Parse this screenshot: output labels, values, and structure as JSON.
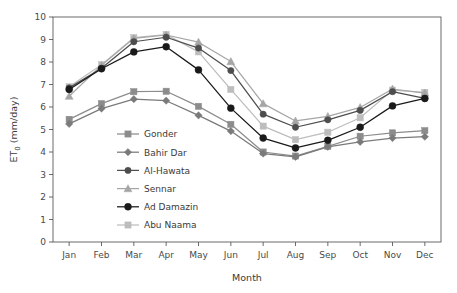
{
  "chart_data": {
    "type": "line",
    "title": "",
    "xlabel": "Month",
    "ylabel": "ET0 (mm/day)",
    "ylabel_base": "ET",
    "ylabel_sub": "0",
    "ylabel_unit": " (mm/day)",
    "categories": [
      "Jan",
      "Feb",
      "Mar",
      "Apr",
      "May",
      "Jun",
      "Jul",
      "Aug",
      "Sep",
      "Oct",
      "Nov",
      "Dec"
    ],
    "ylim": [
      0,
      10
    ],
    "yticks": [
      "0",
      "1",
      "2",
      "3",
      "4",
      "5",
      "6",
      "7",
      "8",
      "9",
      "10"
    ],
    "grid": false,
    "legend_position": "inside-center-left",
    "series": [
      {
        "name": "Gonder",
        "color": "#8c8c8c",
        "marker": "square",
        "values": [
          5.45,
          6.15,
          6.68,
          6.7,
          6.03,
          5.23,
          4.0,
          3.82,
          4.25,
          4.7,
          4.85,
          4.95
        ]
      },
      {
        "name": "Bahir Dar",
        "color": "#7a7a7a",
        "marker": "diamond",
        "values": [
          5.25,
          5.93,
          6.35,
          6.28,
          5.63,
          4.93,
          3.93,
          3.78,
          4.23,
          4.45,
          4.62,
          4.68
        ]
      },
      {
        "name": "Al-Hawata",
        "color": "#4d4d4d",
        "marker": "circle",
        "values": [
          6.85,
          7.72,
          8.9,
          9.1,
          8.62,
          7.62,
          5.68,
          5.1,
          5.43,
          5.85,
          6.68,
          6.38
        ]
      },
      {
        "name": "Sennar",
        "color": "#a6a6a6",
        "marker": "triangle",
        "values": [
          6.48,
          7.85,
          9.05,
          9.2,
          8.88,
          8.02,
          6.15,
          5.38,
          5.58,
          5.98,
          6.8,
          6.62
        ]
      },
      {
        "name": "Ad Damazin",
        "color": "#1a1a1a",
        "marker": "circle",
        "values": [
          6.78,
          7.7,
          8.45,
          8.68,
          7.65,
          5.95,
          4.62,
          4.18,
          4.52,
          5.1,
          6.05,
          6.38
        ]
      },
      {
        "name": "Abu Naama",
        "color": "#bdbdbd",
        "marker": "square",
        "values": [
          6.9,
          7.88,
          9.08,
          9.22,
          8.45,
          6.78,
          5.15,
          4.55,
          4.88,
          5.52,
          6.75,
          6.65
        ]
      }
    ]
  },
  "axes": {
    "y_title": "ET0 (mm/day)",
    "x_title": "Month"
  }
}
